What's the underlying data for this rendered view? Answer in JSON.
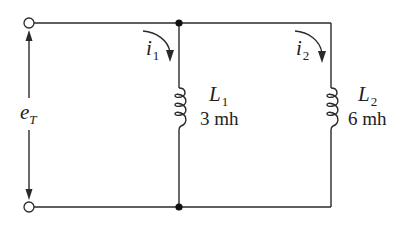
{
  "diagram": {
    "type": "parallel-inductor-circuit",
    "source": {
      "label_main": "e",
      "label_sub": "T"
    },
    "branches": [
      {
        "current_main": "i",
        "current_sub": "1",
        "inductor_main": "L",
        "inductor_sub": "1",
        "value": "3 mh"
      },
      {
        "current_main": "i",
        "current_sub": "2",
        "inductor_main": "L",
        "inductor_sub": "2",
        "value": "6 mh"
      }
    ],
    "colors": {
      "line": "#2a2a2a",
      "junction": "#111111",
      "background": "#ffffff"
    }
  }
}
